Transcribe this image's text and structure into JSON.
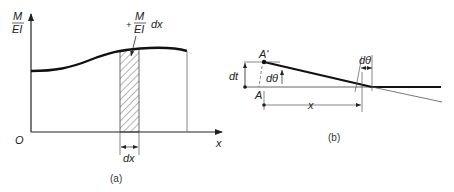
{
  "panel_a": {
    "caption": "(a)",
    "y_axis_label_num": "M",
    "y_axis_label_den": "EI",
    "x_axis_label": "x",
    "origin_label": "O",
    "strip_label_sign": "+",
    "strip_label_num": "M",
    "strip_label_den": "EI",
    "strip_label_suffix": "dx",
    "strip_width_label": "dx"
  },
  "panel_b": {
    "caption": "(b)",
    "point_a_prime": "A'",
    "point_a": "A",
    "dt_label": "dt",
    "dtheta_left_label": "dθ",
    "dtheta_right_label": "dθ",
    "x_label": "x"
  },
  "colors": {
    "ink": "#222222",
    "thin": "#555555",
    "background": "#ffffff"
  }
}
